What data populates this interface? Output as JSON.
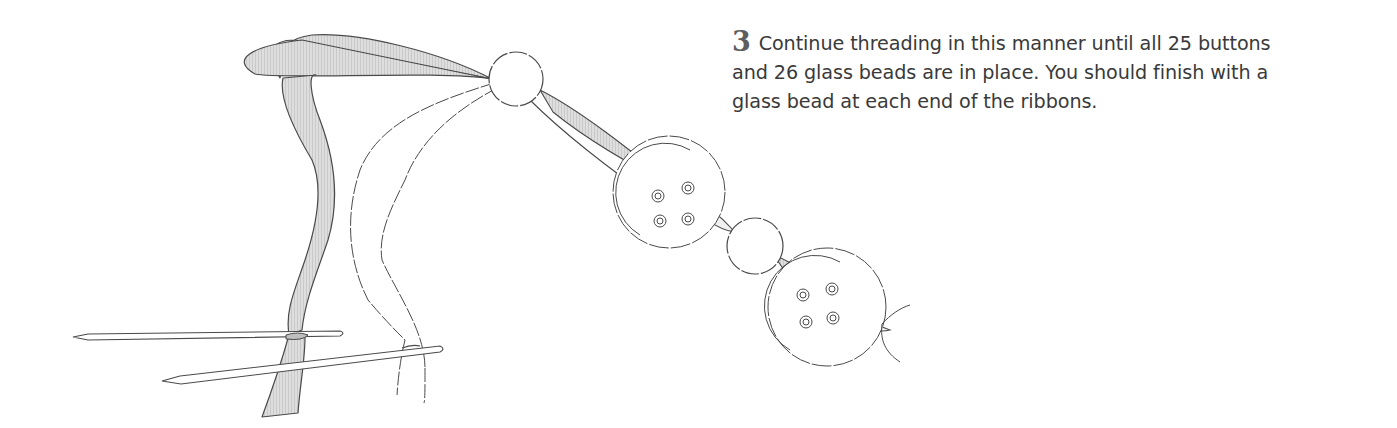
{
  "step": {
    "number": "3",
    "text": "Continue threading in this manner until all 25 buttons and 26 glass beads are in place. You should finish with a glass bead at each end of the ribbons.",
    "lines": [
      "Continue threading in this manner until all 25 buttons",
      "and 26 glass beads are in place. You should finish with a",
      "glass bead at each end of the ribbons."
    ]
  },
  "illustration": {
    "description": "Line drawing of two ribbons tied to knitting needles, threaded through glass beads and four-hole buttons",
    "elements": [
      "ribbon",
      "ribbon",
      "knitting-needle",
      "knitting-needle",
      "glass-bead",
      "button",
      "glass-bead",
      "button"
    ],
    "colors": {
      "ink": "#4a4a4a",
      "ribbon_fill": "#d9d9d9",
      "button_fill": "#f4f4f4"
    }
  }
}
